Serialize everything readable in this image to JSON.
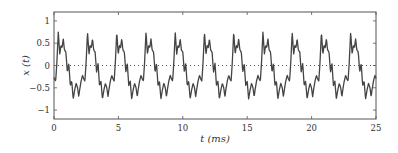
{
  "chart_data": {
    "type": "line",
    "title": "",
    "xlabel": "t (ms)",
    "ylabel": "x (t)",
    "xlim": [
      0,
      25
    ],
    "ylim": [
      -1.2,
      1.2
    ],
    "xticks": [
      0,
      5,
      10,
      15,
      20,
      25
    ],
    "xtick_labels": [
      "0",
      "5",
      "10",
      "15",
      "20",
      "25"
    ],
    "yticks": [
      1,
      0.5,
      0,
      -0.5,
      -1
    ],
    "ytick_labels": [
      "1",
      "0.5",
      "0",
      "−0.5",
      "−1"
    ],
    "grid": false,
    "legend": null,
    "reference_line": {
      "y": 0,
      "style": "dotted"
    },
    "series": [
      {
        "name": "x(t)",
        "color": "#444444",
        "period_ms": 2.27,
        "description": "Periodic waveform (~440 Hz) with harmonics: sharp rise to ~0.75, secondary bump ~0.6, descent with ripples to trough ~-0.75, small bump ~-0.3 before next rise",
        "one_period_shape": {
          "t_frac": [
            0.0,
            0.05,
            0.1,
            0.14,
            0.18,
            0.22,
            0.27,
            0.32,
            0.36,
            0.4,
            0.44,
            0.48,
            0.53,
            0.58,
            0.63,
            0.68,
            0.73,
            0.78,
            0.83,
            0.88,
            0.93,
            0.97,
            1.0
          ],
          "x": [
            -0.55,
            -0.35,
            -0.22,
            -0.3,
            -0.35,
            0.05,
            0.75,
            0.25,
            0.45,
            0.4,
            0.6,
            0.35,
            0.3,
            -0.15,
            0.05,
            -0.45,
            -0.35,
            -0.75,
            -0.55,
            -0.4,
            -0.5,
            -0.7,
            -0.55
          ]
        },
        "phase_ms": -0.28
      }
    ]
  }
}
